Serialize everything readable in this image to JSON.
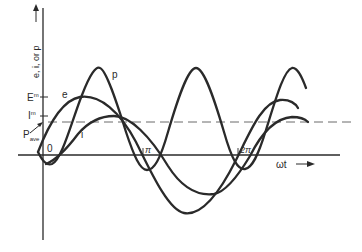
{
  "diagram": {
    "y_axis_label": "e, i, or p",
    "x_axis_label": "ωt",
    "origin_label": "0",
    "tick_labels": {
      "pi": "π",
      "two_pi": "2π"
    },
    "level_labels": {
      "E_max": {
        "main": "E",
        "sup": "m"
      },
      "I_max": {
        "main": "I",
        "sup": "m"
      },
      "P_ave": {
        "main": "P",
        "sub": "ave"
      }
    },
    "curve_labels": {
      "power": "p",
      "voltage": "e",
      "current": "i"
    },
    "colors": {
      "ink": "#2a2a2a",
      "dashed": "#6a6a6a",
      "background": "#ffffff"
    }
  }
}
